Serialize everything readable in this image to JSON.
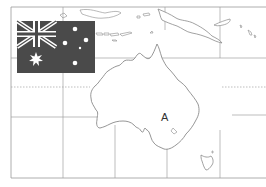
{
  "map": {
    "subject": "Australia and surroundings outline map",
    "region_label": "A",
    "colors": {
      "background": "#ffffff",
      "outline": "#888888",
      "grid": "#999999",
      "flag_field": "#4a4a4a",
      "flag_symbols": "#ffffff"
    }
  },
  "flag": {
    "name": "Australian flag",
    "elements": [
      "union-jack-canton",
      "commonwealth-star",
      "southern-cross-stars"
    ]
  },
  "grid": {
    "vertical_lines": [
      63,
      115,
      167,
      220
    ],
    "horizontal_lines": [
      31,
      57,
      117
    ],
    "tropic_line_dotted": 87
  }
}
